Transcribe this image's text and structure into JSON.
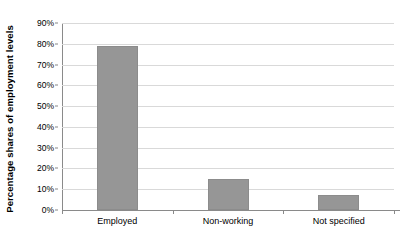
{
  "chart_data": {
    "type": "bar",
    "title": "",
    "xlabel": "",
    "ylabel": "Percentage shares of employment levels",
    "categories": [
      "Employed",
      "Non-working",
      "Not specified"
    ],
    "values": [
      79,
      15,
      7
    ],
    "ylim": [
      0,
      90
    ],
    "ytick_step": 10,
    "ytick_labels": [
      "0%",
      "10%",
      "20%",
      "30%",
      "40%",
      "50%",
      "60%",
      "70%",
      "80%",
      "90%"
    ],
    "ytick_values": [
      0,
      10,
      20,
      30,
      40,
      50,
      60,
      70,
      80,
      90
    ],
    "grid": true,
    "grid_axis": "y",
    "legend": false,
    "legend_position": "none",
    "series": [
      {
        "name": "Percentage shares of employment levels",
        "values": [
          79,
          15,
          7
        ]
      }
    ]
  },
  "colors": {
    "bar_fill": "#969696",
    "bar_border": "#8c8c8c",
    "gridline": "#d9d9d9",
    "axis_line": "#8a8a8a",
    "text": "#000000",
    "background": "#ffffff"
  }
}
